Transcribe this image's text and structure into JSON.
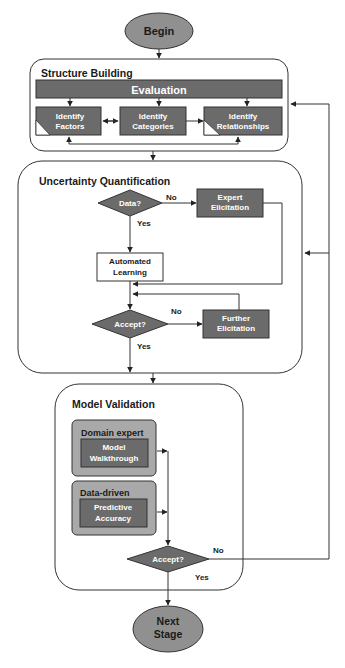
{
  "colors": {
    "dark_box": "#6b6b6b",
    "oval": "#909090",
    "group_box": "#a9a9a9",
    "line": "#333333",
    "text_light": "#ffffff",
    "text_dark": "#1a1a1a"
  },
  "begin": {
    "label": "Begin"
  },
  "structure_building": {
    "title": "Structure Building",
    "evaluation": "Evaluation",
    "identify_factors": [
      "Identify",
      "Factors"
    ],
    "identify_categories": [
      "Identify",
      "Categories"
    ],
    "identify_relationships": [
      "Identify",
      "Relationships"
    ]
  },
  "uncertainty_quantification": {
    "title": "Uncertainty Quantification",
    "data_decision": "Data?",
    "data_no": "No",
    "data_yes": "Yes",
    "expert_elicitation": [
      "Expert",
      "Elicitation"
    ],
    "automated_learning": [
      "Automated",
      "Learning"
    ],
    "accept_decision": "Accept?",
    "accept_no": "No",
    "accept_yes": "Yes",
    "further_elicitation": [
      "Further",
      "Elicitation"
    ]
  },
  "model_validation": {
    "title": "Model Validation",
    "domain_expert": {
      "title": "Domain expert",
      "box": [
        "Model",
        "Walkthrough"
      ]
    },
    "data_driven": {
      "title": "Data-driven",
      "box": [
        "Predictive",
        "Accuracy"
      ]
    },
    "accept_decision": "Accept?",
    "accept_no": "No",
    "accept_yes": "Yes"
  },
  "next_stage": {
    "label": [
      "Next",
      "Stage"
    ]
  }
}
